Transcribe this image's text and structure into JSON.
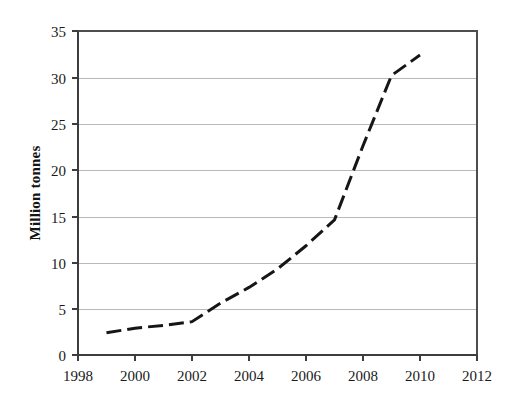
{
  "chart_data": {
    "type": "line",
    "title": "",
    "subtitle": "",
    "xlabel": "",
    "ylabel": "Million tonnes",
    "xlim": [
      1998,
      2012
    ],
    "ylim": [
      0,
      35
    ],
    "grid": "horizontal",
    "legend": "none",
    "x_tick_labels": [
      "1998",
      "2000",
      "2002",
      "2004",
      "2006",
      "2008",
      "2010",
      "2012"
    ],
    "x_tick_values": [
      1998,
      2000,
      2002,
      2004,
      2006,
      2008,
      2010,
      2012
    ],
    "x_tick_step": 2,
    "y_tick_labels": [
      "0",
      "5",
      "10",
      "15",
      "20",
      "25",
      "30",
      "35"
    ],
    "y_tick_values": [
      0,
      5,
      10,
      15,
      20,
      25,
      30,
      35
    ],
    "y_tick_step": 5,
    "series": [
      {
        "name": "Million tonnes",
        "color": "#161616",
        "line_style": "dashed",
        "line_width": 3,
        "marker": "none",
        "x": [
          1999,
          2000,
          2001,
          2002,
          2003,
          2004,
          2005,
          2006,
          2007,
          2008,
          2009,
          2010
        ],
        "values": [
          2.4,
          2.9,
          3.2,
          3.6,
          5.6,
          7.3,
          9.3,
          11.8,
          14.6,
          22.6,
          30.2,
          32.4
        ]
      }
    ],
    "annotations": []
  },
  "axes": {
    "y_axis_title": "Million tonnes"
  }
}
